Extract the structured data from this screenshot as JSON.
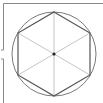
{
  "diagram": {
    "title": "",
    "shape": "regular hexagon inscribed in circle",
    "circle": {
      "cx": 54,
      "cy": 54,
      "r": 42
    },
    "hexagon_vertices": [
      [
        54,
        12
      ],
      [
        90,
        33
      ],
      [
        90,
        75
      ],
      [
        54,
        96
      ],
      [
        18,
        75
      ],
      [
        18,
        33
      ]
    ],
    "diagonals": 3,
    "center_point": [
      54,
      54
    ],
    "colors": {
      "frame": "#8a8a8a",
      "circle": "#7a7a7a",
      "hexagon": "#555555",
      "diagonals": "#b5b5b5",
      "center": "#222222"
    }
  }
}
